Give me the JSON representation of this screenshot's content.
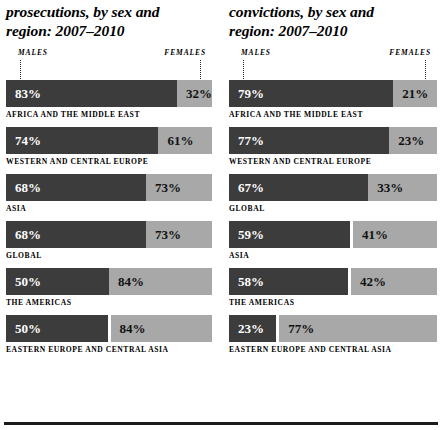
{
  "figure": {
    "legend_male": "MALES",
    "legend_female": "FEMALES",
    "accent_dark": "#3c3c3c",
    "accent_light": "#a8a8a8"
  },
  "chart_data": {
    "type": "bar",
    "xlabel": "",
    "ylabel": "",
    "grid": false,
    "legend_position": "top",
    "legend": [
      "MALES",
      "FEMALES"
    ],
    "panels": [
      {
        "id": "prosecutions",
        "title_line1": "prosecutions, by sex and",
        "title_line2": "region: 2007–2010",
        "categories": [
          "AFRICA AND THE MIDDLE EAST",
          "WESTERN AND CENTRAL EUROPE",
          "ASIA",
          "GLOBAL",
          "THE AMERICAS",
          "EASTERN EUROPE AND CENTRAL ASIA"
        ],
        "series": [
          {
            "name": "MALES",
            "values": [
              83,
              74,
              68,
              68,
              50,
              50
            ]
          },
          {
            "name": "FEMALES",
            "values": [
              32,
              61,
              73,
              73,
              84,
              84
            ]
          }
        ],
        "rows": [
          {
            "region": "AFRICA AND THE MIDDLE EAST",
            "male": "83%",
            "female": "32%",
            "male_width": 83,
            "female_width": 17,
            "split": false
          },
          {
            "region": "WESTERN AND CENTRAL EUROPE",
            "male": "74%",
            "female": "61%",
            "male_width": 74,
            "female_width": 26,
            "split": false
          },
          {
            "region": "ASIA",
            "male": "68%",
            "female": "73%",
            "male_width": 68,
            "female_width": 32,
            "split": false
          },
          {
            "region": "GLOBAL",
            "male": "68%",
            "female": "73%",
            "male_width": 68,
            "female_width": 32,
            "split": false
          },
          {
            "region": "THE AMERICAS",
            "male": "50%",
            "female": "84%",
            "male_width": 50,
            "female_width": 50,
            "split": false
          },
          {
            "region": "EASTERN EUROPE AND CENTRAL ASIA",
            "male": "50%",
            "female": "84%",
            "male_width": 50,
            "female_width": 50,
            "split": true
          }
        ]
      },
      {
        "id": "convictions",
        "title_line1": "convictions, by sex and",
        "title_line2": "region: 2007–2010",
        "categories": [
          "AFRICA AND THE MIDDLE EAST",
          "WESTERN AND CENTRAL EUROPE",
          "GLOBAL",
          "ASIA",
          "THE AMERICAS",
          "EASTERN EUROPE AND CENTRAL ASIA"
        ],
        "series": [
          {
            "name": "MALES",
            "values": [
              79,
              77,
              67,
              59,
              58,
              23
            ]
          },
          {
            "name": "FEMALES",
            "values": [
              21,
              23,
              33,
              41,
              42,
              77
            ]
          }
        ],
        "rows": [
          {
            "region": "AFRICA AND THE MIDDLE EAST",
            "male": "79%",
            "female": "21%",
            "male_width": 79,
            "female_width": 21,
            "split": false
          },
          {
            "region": "WESTERN AND CENTRAL EUROPE",
            "male": "77%",
            "female": "23%",
            "male_width": 77,
            "female_width": 23,
            "split": false
          },
          {
            "region": "GLOBAL",
            "male": "67%",
            "female": "33%",
            "male_width": 67,
            "female_width": 33,
            "split": false
          },
          {
            "region": "ASIA",
            "male": "59%",
            "female": "41%",
            "male_width": 59,
            "female_width": 41,
            "split": true
          },
          {
            "region": "THE AMERICAS",
            "male": "58%",
            "female": "42%",
            "male_width": 58,
            "female_width": 42,
            "split": true
          },
          {
            "region": "EASTERN EUROPE AND CENTRAL ASIA",
            "male": "23%",
            "female": "77%",
            "male_width": 23,
            "female_width": 77,
            "split": true
          }
        ]
      }
    ]
  }
}
